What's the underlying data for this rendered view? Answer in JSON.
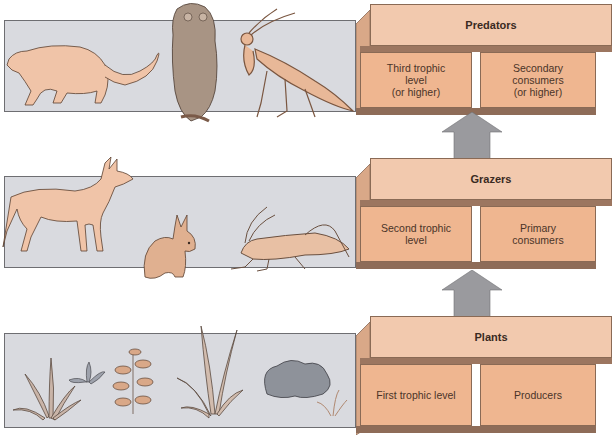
{
  "diagram": {
    "levels": [
      {
        "name": "Predators",
        "trophic_level": "Third trophic\nlevel\n(or higher)",
        "consumer_type": "Secondary\nconsumers\n(or higher)",
        "organisms": [
          "mountain-lion",
          "owl",
          "praying-mantis"
        ]
      },
      {
        "name": "Grazers",
        "trophic_level": "Second trophic\nlevel",
        "consumer_type": "Primary\nconsumers",
        "organisms": [
          "deer",
          "rabbit",
          "grasshopper"
        ]
      },
      {
        "name": "Plants",
        "trophic_level": "First trophic level",
        "consumer_type": "Producers",
        "organisms": [
          "grass",
          "small-plant",
          "leafy-shrub",
          "tall-grass",
          "broadleaf-plant",
          "seedling"
        ]
      }
    ],
    "colors": {
      "panel_bg": "#d9dadf",
      "box_top": "#f2c9ae",
      "box_cell": "#efb690",
      "box_shadow": "#9c7660",
      "arrow": "#9a9a9e",
      "animal_fill": "#f0c4a8",
      "plant_fill": "#c9a28a"
    }
  }
}
